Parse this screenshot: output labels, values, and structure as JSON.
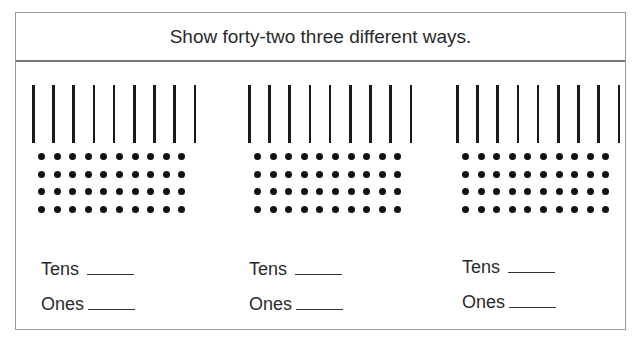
{
  "header": {
    "title": "Show forty-two three different ways."
  },
  "groups": [
    {
      "tens_rods": 9,
      "ones_rows": 4,
      "ones_cols": 10,
      "tens_label": "Tens",
      "ones_label": "Ones"
    },
    {
      "tens_rods": 9,
      "ones_rows": 4,
      "ones_cols": 10,
      "tens_label": "Tens",
      "ones_label": "Ones"
    },
    {
      "tens_rods": 9,
      "ones_rows": 4,
      "ones_cols": 10,
      "tens_label": "Tens",
      "ones_label": "Ones"
    }
  ]
}
